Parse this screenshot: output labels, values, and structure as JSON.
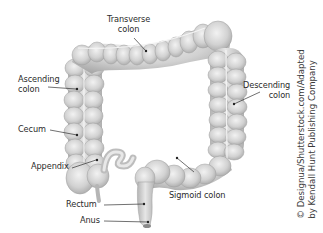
{
  "figure": {
    "labels": {
      "transverse": "Transverse\ncolon",
      "transverse_l1": "Transverse",
      "transverse_l2": "colon",
      "ascending_l1": "Ascending",
      "ascending_l2": "colon",
      "descending_l1": "Descending",
      "descending_l2": "colon",
      "cecum": "Cecum",
      "appendix": "Appendix",
      "sigmoid": "Sigmoid colon",
      "rectum": "Rectum",
      "anus": "Anus"
    },
    "credit": {
      "line1": "© Designua/Shutterstock.com/Adapted",
      "line2": "by Kendall Hunt Publishing Company"
    },
    "colors": {
      "tissue": "#d4d4d4",
      "tissue_shade": "#a9a9a9",
      "tissue_light": "#ececec",
      "leader_line": "#333333",
      "text": "#2b2b2b"
    }
  }
}
